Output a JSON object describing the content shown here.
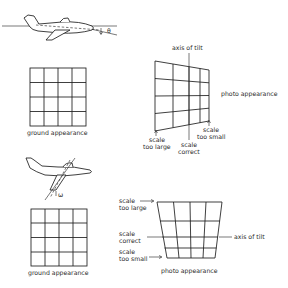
{
  "panel_pitch": {
    "angle_symbol": "θ",
    "ground_grid": {
      "rows": 4,
      "cols": 4,
      "label": "ground appearance"
    },
    "photo": {
      "label": "photo appearance",
      "axis_label": "axis of tilt",
      "scale_too_large": [
        "scale",
        "too large"
      ],
      "scale_correct": [
        "scale",
        "correct"
      ],
      "scale_too_small": [
        "scale",
        "too small"
      ]
    }
  },
  "panel_roll": {
    "angle_symbol": "ω",
    "ground_grid": {
      "rows": 4,
      "cols": 4,
      "label": "ground appearance"
    },
    "photo": {
      "label": "photo appearance",
      "axis_label": "axis of tilt",
      "scale_too_large": [
        "scale",
        "too large"
      ],
      "scale_correct": [
        "scale",
        "correct"
      ],
      "scale_too_small": [
        "scale",
        "too small"
      ]
    }
  }
}
